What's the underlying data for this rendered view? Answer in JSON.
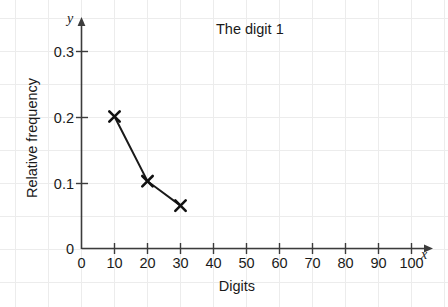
{
  "chart_data": {
    "type": "line",
    "title": "The digit 1",
    "xlabel": "Digits",
    "ylabel": "Relative frequency",
    "x_axis_letter": "x",
    "y_axis_letter": "y",
    "x": [
      10,
      20,
      30
    ],
    "values": [
      0.2,
      0.102,
      0.065
    ],
    "series": [
      {
        "name": "The digit 1",
        "x": [
          10,
          20,
          30
        ],
        "values": [
          0.2,
          0.102,
          0.065
        ]
      }
    ],
    "xlim": [
      0,
      110
    ],
    "ylim": [
      0,
      0.34
    ],
    "xticks": [
      0,
      10,
      20,
      30,
      40,
      50,
      60,
      70,
      80,
      90,
      100
    ],
    "xtick_labels": [
      "0",
      "10",
      "20",
      "30",
      "40",
      "50",
      "60",
      "70",
      "80",
      "90",
      "100"
    ],
    "yticks": [
      0,
      0.1,
      0.2,
      0.3
    ],
    "ytick_labels": [
      "0",
      "0.1",
      "0.2",
      "0.3"
    ],
    "grid": true,
    "legend": false,
    "marker": "x-cross",
    "line_color": "#1a1a1a",
    "grid_color": "#e9e9e9",
    "axis_color": "#3c3c3c"
  }
}
